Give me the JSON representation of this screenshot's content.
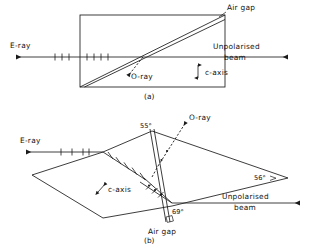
{
  "figure": {
    "panels": [
      {
        "id": "a",
        "caption": "(a)",
        "labels": {
          "air_gap": "Air gap",
          "e_ray": "E-ray",
          "o_ray": "O-ray",
          "unpolarised_line1": "Unpolarised",
          "unpolarised_line2": "beam",
          "c_axis": "c-axis"
        }
      },
      {
        "id": "b",
        "caption": "(b)",
        "labels": {
          "air_gap": "Air gap",
          "e_ray": "E-ray",
          "o_ray": "O-ray",
          "unpolarised_line1": "Unpolarised",
          "unpolarised_line2": "beam",
          "c_axis": "c-axis"
        },
        "angles": {
          "top": "55°",
          "right": "56°",
          "bottom": "69°"
        }
      }
    ],
    "colors": {
      "ink": "#1a1a1a",
      "ray": "#2b2b2b",
      "background": "#ffffff"
    }
  }
}
